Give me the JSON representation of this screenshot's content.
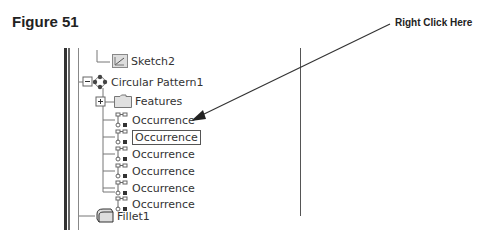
{
  "figure": {
    "title": "Figure 51"
  },
  "callout": {
    "text": "Right Click Here"
  },
  "tree": {
    "sketch": {
      "label": "Sketch2",
      "icon": "sketch-icon"
    },
    "pattern": {
      "label": "Circular Pattern1",
      "icon": "circular-pattern-icon",
      "expander": "minus"
    },
    "features": {
      "label": "Features",
      "icon": "folder-icon",
      "expander": "plus"
    },
    "occurrences": [
      {
        "label": "Occurrence",
        "selected": false
      },
      {
        "label": "Occurrence",
        "selected": true
      },
      {
        "label": "Occurrence",
        "selected": false
      },
      {
        "label": "Occurrence",
        "selected": false
      },
      {
        "label": "Occurrence",
        "selected": false
      },
      {
        "label": "Occurrence",
        "selected": false
      }
    ],
    "fillet": {
      "label": "Fillet1",
      "icon": "fillet-icon"
    }
  }
}
